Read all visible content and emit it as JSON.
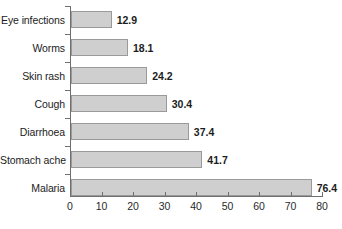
{
  "chart_data": {
    "type": "bar",
    "orientation": "horizontal",
    "title": "",
    "subtitle": "",
    "xlabel": "",
    "ylabel": "",
    "categories": [
      "Eye infections",
      "Worms",
      "Skin rash",
      "Cough",
      "Diarrhoea",
      "Stomach ache",
      "Malaria"
    ],
    "values": [
      12.9,
      18.1,
      24.2,
      30.4,
      37.4,
      41.7,
      76.4
    ],
    "value_labels": [
      "12.9",
      "18.1",
      "24.2",
      "30.4",
      "37.4",
      "41.7",
      "76.4"
    ],
    "xlim": [
      0,
      80
    ],
    "xticks": [
      0,
      10,
      20,
      30,
      40,
      50,
      60,
      70,
      80
    ],
    "xtick_labels": [
      "0",
      "10",
      "20",
      "30",
      "40",
      "50",
      "60",
      "70",
      "80"
    ],
    "grid": false,
    "legend": false,
    "bar_fill_color": "#cfcfcf",
    "bar_border_color": "#9a9a9a",
    "axis_color": "#6f6f6f",
    "text_color": "#1c1c1c"
  }
}
